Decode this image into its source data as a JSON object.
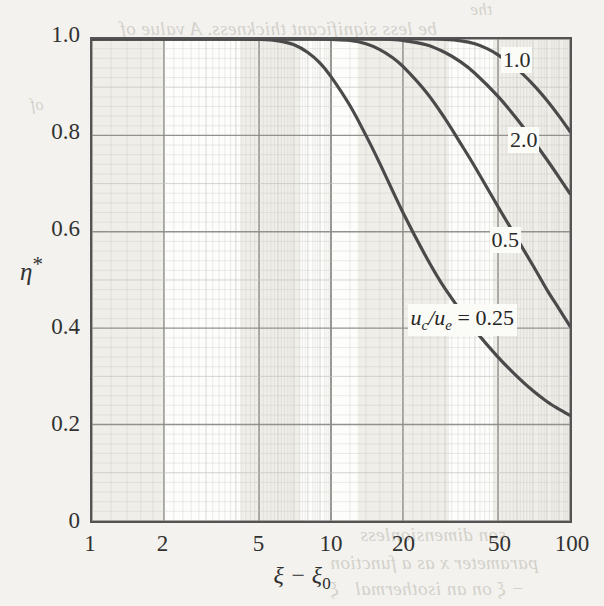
{
  "figure": {
    "ylabel": "η",
    "ylabel_star": "*",
    "xlabel_main": "ξ − ξ",
    "xlabel_sub": "0"
  },
  "ghost_text": [
    {
      "text": "be less significant  thickness.  A value of",
      "x": 120,
      "y": 18,
      "size": 19
    },
    {
      "text": "the",
      "x": 470,
      "y": 0,
      "size": 17
    },
    {
      "text": "of",
      "x": 30,
      "y": 96,
      "size": 16
    },
    {
      "text": "son dimensionless",
      "x": 360,
      "y": 524,
      "size": 19
    },
    {
      "text": "parameter  x  as a function",
      "x": 330,
      "y": 552,
      "size": 19
    },
    {
      "text": "− ξ  on an isothermal",
      "x": 355,
      "y": 578,
      "size": 19
    },
    {
      "text": "ξ",
      "x": 330,
      "y": 578,
      "size": 19
    }
  ],
  "axes": {
    "y_ticks": [
      {
        "label": "1.0",
        "value": 1.0
      },
      {
        "label": "0.8",
        "value": 0.8
      },
      {
        "label": "0.6",
        "value": 0.6
      },
      {
        "label": "0.4",
        "value": 0.4
      },
      {
        "label": "0.2",
        "value": 0.2
      },
      {
        "label": "0",
        "value": 0.0
      }
    ],
    "x_ticks": [
      {
        "label": "1",
        "value": 1
      },
      {
        "label": "2",
        "value": 2
      },
      {
        "label": "5",
        "value": 5
      },
      {
        "label": "10",
        "value": 10
      },
      {
        "label": "20",
        "value": 20
      },
      {
        "label": "50",
        "value": 50
      },
      {
        "label": "100",
        "value": 100
      }
    ]
  },
  "annotations": {
    "ratio_label_main": "u",
    "ratio_sub_c": "c",
    "ratio_slash": "/u",
    "ratio_sub_e": "e",
    "ratio_equals": " = 0.25"
  },
  "chart_data": {
    "type": "line",
    "title": "",
    "xlabel": "ξ − ξ0",
    "ylabel": "η*",
    "xscale": "log",
    "xlim": [
      1,
      100
    ],
    "ylim": [
      0,
      1.0
    ],
    "grid": true,
    "legend": "inline-curve-labels",
    "series": [
      {
        "name": "0.25",
        "label": "uc/ue = 0.25",
        "points": [
          [
            1,
            1.0
          ],
          [
            2,
            1.0
          ],
          [
            3,
            1.0
          ],
          [
            4,
            1.0
          ],
          [
            5,
            0.999
          ],
          [
            6,
            0.996
          ],
          [
            7,
            0.988
          ],
          [
            8,
            0.972
          ],
          [
            9,
            0.95
          ],
          [
            10,
            0.922
          ],
          [
            12,
            0.862
          ],
          [
            14,
            0.8
          ],
          [
            16,
            0.742
          ],
          [
            20,
            0.64
          ],
          [
            25,
            0.548
          ],
          [
            30,
            0.482
          ],
          [
            40,
            0.396
          ],
          [
            50,
            0.34
          ],
          [
            60,
            0.3
          ],
          [
            70,
            0.27
          ],
          [
            80,
            0.248
          ],
          [
            90,
            0.232
          ],
          [
            100,
            0.219
          ]
        ]
      },
      {
        "name": "0.5",
        "label": "0.5",
        "points": [
          [
            1,
            1.0
          ],
          [
            5,
            1.0
          ],
          [
            8,
            1.0
          ],
          [
            10,
            0.999
          ],
          [
            12,
            0.997
          ],
          [
            14,
            0.99
          ],
          [
            16,
            0.978
          ],
          [
            18,
            0.962
          ],
          [
            20,
            0.943
          ],
          [
            25,
            0.89
          ],
          [
            30,
            0.835
          ],
          [
            35,
            0.782
          ],
          [
            40,
            0.735
          ],
          [
            50,
            0.652
          ],
          [
            60,
            0.586
          ],
          [
            70,
            0.53
          ],
          [
            80,
            0.48
          ],
          [
            90,
            0.44
          ],
          [
            100,
            0.404
          ]
        ]
      },
      {
        "name": "1.0",
        "label": "1.0",
        "points": [
          [
            1,
            1.0
          ],
          [
            10,
            1.0
          ],
          [
            14,
            1.0
          ],
          [
            18,
            0.999
          ],
          [
            20,
            0.997
          ],
          [
            25,
            0.988
          ],
          [
            30,
            0.972
          ],
          [
            35,
            0.952
          ],
          [
            40,
            0.929
          ],
          [
            50,
            0.881
          ],
          [
            60,
            0.834
          ],
          [
            70,
            0.79
          ],
          [
            80,
            0.75
          ],
          [
            90,
            0.713
          ],
          [
            100,
            0.679
          ]
        ]
      },
      {
        "name": "2.0",
        "label": "2.0",
        "points": [
          [
            1,
            1.0
          ],
          [
            20,
            1.0
          ],
          [
            25,
            1.0
          ],
          [
            30,
            0.999
          ],
          [
            35,
            0.996
          ],
          [
            40,
            0.99
          ],
          [
            45,
            0.98
          ],
          [
            50,
            0.967
          ],
          [
            60,
            0.938
          ],
          [
            70,
            0.906
          ],
          [
            80,
            0.873
          ],
          [
            90,
            0.84
          ],
          [
            100,
            0.808
          ]
        ]
      }
    ],
    "curve_labels": [
      {
        "text": "1.0",
        "x": 58,
        "y": 0.955
      },
      {
        "text": "2.0",
        "x": 62,
        "y": 0.79
      },
      {
        "text": "0.5",
        "x": 52,
        "y": 0.585
      },
      {
        "text": "uc/ue = 0.25",
        "x": 22,
        "y": 0.425
      }
    ]
  },
  "colors": {
    "paper": "#f3f2ee",
    "plot_bg": "#fdfdfb",
    "frame": "#545454",
    "curve": "#4a4a4a",
    "grid_minor": "#c4c4c0",
    "grid_major": "#8d8d8a",
    "text": "#2b2b2b"
  }
}
